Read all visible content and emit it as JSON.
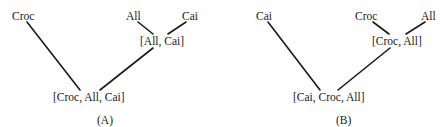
{
  "panels": [
    {
      "caption": "(A)",
      "leaves": [
        "Croc",
        "All",
        "Cai"
      ],
      "inner_node": "[All, Cai]",
      "root": "[Croc, All, Cai]"
    },
    {
      "caption": "(B)",
      "leaves": [
        "Cai",
        "Croc",
        "All"
      ],
      "inner_node": "[Croc, All]",
      "root": "[Cai, Croc, All]"
    }
  ],
  "colors": {
    "line": "#1a1a1a",
    "text": "#1a1a1a",
    "background": "#ffffff"
  }
}
